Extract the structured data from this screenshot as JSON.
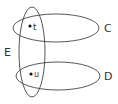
{
  "diagram": {
    "type": "venn-hypergraph",
    "stroke_color": "#444444",
    "sets": [
      {
        "label": "C",
        "cx": 56,
        "cy": 28,
        "rx": 43,
        "ry": 14,
        "label_x": 107,
        "label_y": 32
      },
      {
        "label": "D",
        "cx": 58,
        "cy": 76,
        "rx": 42,
        "ry": 14,
        "label_x": 107,
        "label_y": 80
      },
      {
        "label": "E",
        "cx": 32,
        "cy": 52,
        "rx": 13,
        "ry": 45,
        "label_x": 5,
        "label_y": 56
      }
    ],
    "points": [
      {
        "label": "t",
        "x": 30,
        "y": 26,
        "label_x": 34,
        "label_y": 29
      },
      {
        "label": "u",
        "x": 31,
        "y": 74,
        "label_x": 34,
        "label_y": 77
      }
    ]
  }
}
